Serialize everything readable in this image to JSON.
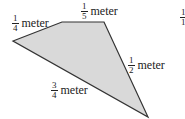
{
  "diagram": {
    "shape": "quadrilateral",
    "fill": "#d9d9d9",
    "stroke": "#333333",
    "sides": [
      {
        "num": "1",
        "den": "4",
        "unit": "meter"
      },
      {
        "num": "1",
        "den": "5",
        "unit": "meter"
      },
      {
        "num": "1",
        "den": "2",
        "unit": "meter"
      },
      {
        "num": "3",
        "den": "4",
        "unit": "meter"
      }
    ],
    "cutoff_fraction": {
      "num": "1",
      "den": "1"
    }
  }
}
